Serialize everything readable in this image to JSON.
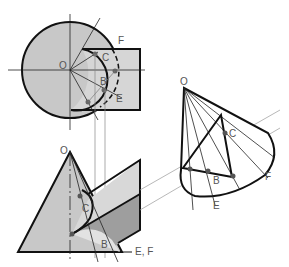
{
  "figure": {
    "colors": {
      "fill_light": "#d4d4d4",
      "fill_mid": "#bdbdbd",
      "fill_dark": "#9a9a9a",
      "stroke": "#111111",
      "thin": "#777777"
    },
    "plan_view": {
      "labels": {
        "apex": "O",
        "c": "C",
        "b": "B",
        "f": "F",
        "e": "E"
      }
    },
    "elevation_view": {
      "labels": {
        "apex": "O",
        "c": "C",
        "b": "B",
        "ef": "E, F"
      }
    },
    "auxiliary_view": {
      "labels": {
        "apex": "O",
        "c": "C",
        "b": "B",
        "f": "F",
        "e": "E"
      }
    }
  }
}
